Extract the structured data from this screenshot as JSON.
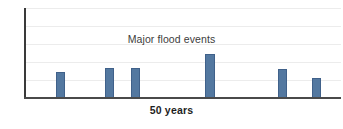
{
  "chart_data": {
    "type": "bar",
    "title": "Major flood events",
    "xlabel": "50 years",
    "ylabel": "",
    "categories": [
      "1",
      "2",
      "3",
      "4",
      "5",
      "6"
    ],
    "values": [
      2.6,
      3.0,
      3.0,
      4.4,
      2.9,
      2.0
    ],
    "ylim": [
      0,
      9
    ],
    "xlim": [
      0,
      50
    ],
    "bar_positions_years": [
      5,
      13,
      17,
      29,
      41,
      46
    ],
    "grid": true,
    "gridlines_y": [
      1.8,
      3.6,
      5.4,
      7.2,
      9.0
    ],
    "legend": null,
    "series": [
      {
        "name": "Major flood events",
        "values": [
          2.6,
          3.0,
          3.0,
          4.4,
          2.9,
          2.0
        ]
      }
    ],
    "annotations": [],
    "colors": {
      "bar_fill": "#5378a0",
      "bar_border": "#40618a",
      "gridline": "#ececec",
      "axis": "#3a3a3a",
      "title_text": "#3c3c3c",
      "xlabel_text": "#1e1e1e",
      "background": "#ffffff"
    }
  }
}
